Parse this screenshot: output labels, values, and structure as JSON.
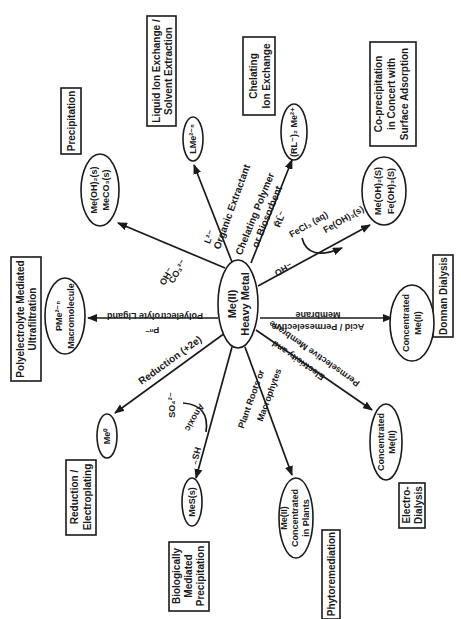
{
  "center": {
    "line1": "Me(II)",
    "line2": "Heavy Metal"
  },
  "branches": [
    {
      "id": "precipitation",
      "process": "Precipitation",
      "reagent": "OH⁻",
      "reagent2": "CO₃²⁻",
      "product1": "Me(OH)₂(s)",
      "product2": "MeCO₃(s)"
    },
    {
      "id": "liquid-ion-exchange",
      "process_line1": "Liquid Ion Exchange /",
      "process_line2": "Solvent Extraction",
      "reagent": "L²⁻",
      "path_label": "Organic Extractant",
      "product": "LMe²⁻ⁿ"
    },
    {
      "id": "chelating-ion-exchange",
      "process_line1": "Chelating",
      "process_line2": "Ion Exchange",
      "path_line1": "Chelating Polymer",
      "path_line2": "or Biosorbent",
      "reagent": "R̄L̄⁻",
      "product": "(RL⁻)₂ Me²⁺"
    },
    {
      "id": "co-precipitation",
      "process_line1": "Co-precipitation",
      "process_line2": "in Concert with",
      "process_line3": "Surface Adsorption",
      "reagent": "OH⁻",
      "side_reagent": "FeCl₃ (aq)",
      "side_product": "Fe(OH)₃(s)",
      "product1": "Me(OH)₂(S)",
      "product2": "Fe(OH)₃(S)"
    },
    {
      "id": "donnan-dialysis",
      "process": "Donnan Dialysis",
      "path_line1": "Acid / Permeselective",
      "path_line2": "Membrane",
      "product_line1": "Concentrated",
      "product_line2": "Me(II)"
    },
    {
      "id": "electrodialysis",
      "process_line1": "Electro-",
      "process_line2": "Dialysis",
      "path_line1": "Electricity and",
      "path_line2": "Permselective Membrane",
      "product_line1": "Concentrated",
      "product_line2": "Me(II)"
    },
    {
      "id": "phytoremediation",
      "process": "Phytoremediation",
      "path_line1": "Plant Roots or",
      "path_line2": "Macrophytes",
      "product_line1": "Me(II)",
      "product_line2": "Concentrated",
      "product_line3": "in Plants"
    },
    {
      "id": "biological-precipitation",
      "process_line1": "Biologically",
      "process_line2": "Mediated",
      "process_line3": "Precipitation",
      "side_reagent": "SO₄²⁻",
      "side_label": "Anoxic",
      "reagent": "HS⁻",
      "product": "MeS(s)"
    },
    {
      "id": "electroplating",
      "process_line1": "Reduction /",
      "process_line2": "Electroplating",
      "path_label": "Reduction (+2e)",
      "product": "Me⁰"
    },
    {
      "id": "ultrafiltration",
      "process_line1": "Polyelectrolyte Mediated",
      "process_line2": "Ultrafiltration",
      "path_label": "Polyelectrolyte Ligand",
      "reagent": "Pⁿ⁻",
      "product_line1": "PMe²⁻ⁿ",
      "product_line2": "Macromolecule"
    }
  ]
}
